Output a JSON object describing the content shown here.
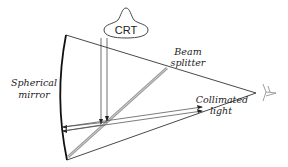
{
  "figure": {
    "type": "optical-diagram"
  },
  "labels": {
    "crt": "CRT",
    "beam_splitter_line1": "Beam",
    "beam_splitter_line2": "splitter",
    "mirror_line1": "Spherical",
    "mirror_line2": "mirror",
    "collimated_line1": "Collimated",
    "collimated_line2": "light"
  },
  "components": [
    {
      "id": "crt",
      "name": "CRT"
    },
    {
      "id": "beam-splitter",
      "name": "Beam splitter"
    },
    {
      "id": "spherical-mirror",
      "name": "Spherical mirror"
    },
    {
      "id": "eye",
      "name": "Viewer eye"
    }
  ],
  "colors": {
    "line": "#222222",
    "splitter": "#a8a8a8",
    "eye": "#888888"
  }
}
